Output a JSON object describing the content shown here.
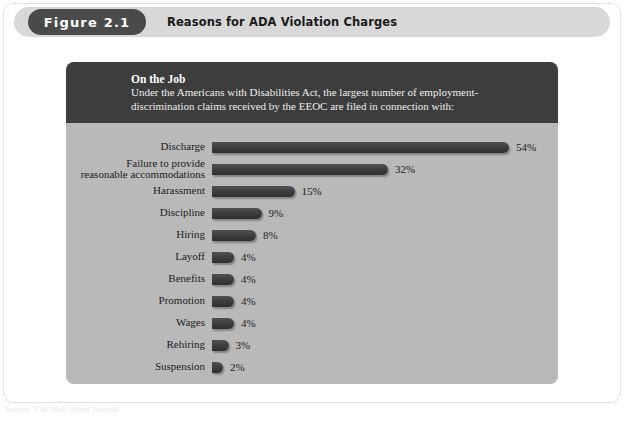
{
  "figure": {
    "pill_label": "Figure 2.1",
    "title": "Reasons for ADA Violation Charges"
  },
  "intro": {
    "heading": "On the Job",
    "body": "Under the Americans with Disabilities Act, the largest number of employment-discrimination claims received by the EEOC are filed in connection with:"
  },
  "footer": {
    "source": "Source: The Wall Street Journal"
  },
  "colors": {
    "header_band": "#d8d8d8",
    "pill": "#4a4a4a",
    "intro_panel": "#3d3d3d",
    "chart_panel": "#b9b9b9",
    "bar": "#3f3f3f",
    "text": "#1c1c1c"
  },
  "chart_data": {
    "type": "bar",
    "orientation": "horizontal",
    "title": "Reasons for ADA Violation Charges",
    "subtitle": "On the Job",
    "xlabel": "",
    "ylabel": "",
    "xlim": [
      0,
      54
    ],
    "grid": false,
    "legend": false,
    "value_suffix": "%",
    "categories": [
      "Discharge",
      "Failure to provide\nreasonable accommodations",
      "Harassment",
      "Discipline",
      "Hiring",
      "Layoff",
      "Benefits",
      "Promotion",
      "Wages",
      "Rehiring",
      "Suspension"
    ],
    "values": [
      54,
      32,
      15,
      9,
      8,
      4,
      4,
      4,
      4,
      3,
      2
    ],
    "value_labels": [
      "54%",
      "32%",
      "15%",
      "9%",
      "8%",
      "4%",
      "4%",
      "4%",
      "4%",
      "3%",
      "2%"
    ],
    "bars": [
      {
        "label": "Discharge",
        "value": 54,
        "value_label": "54%"
      },
      {
        "label": "Failure to provide\nreasonable accommodations",
        "value": 32,
        "value_label": "32%"
      },
      {
        "label": "Harassment",
        "value": 15,
        "value_label": "15%"
      },
      {
        "label": "Discipline",
        "value": 9,
        "value_label": "9%"
      },
      {
        "label": "Hiring",
        "value": 8,
        "value_label": "8%"
      },
      {
        "label": "Layoff",
        "value": 4,
        "value_label": "4%"
      },
      {
        "label": "Benefits",
        "value": 4,
        "value_label": "4%"
      },
      {
        "label": "Promotion",
        "value": 4,
        "value_label": "4%"
      },
      {
        "label": "Wages",
        "value": 4,
        "value_label": "4%"
      },
      {
        "label": "Rehiring",
        "value": 3,
        "value_label": "3%"
      },
      {
        "label": "Suspension",
        "value": 2,
        "value_label": "2%"
      }
    ]
  }
}
